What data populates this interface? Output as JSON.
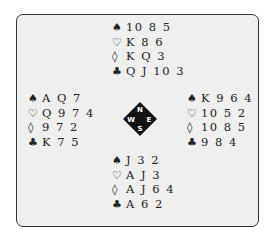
{
  "hands": {
    "north": [
      {
        "suit": "spades",
        "glyph": "♠",
        "cards": "10 8 5"
      },
      {
        "suit": "hearts",
        "glyph": "♡",
        "cards": "K 8 6"
      },
      {
        "suit": "diamonds",
        "glyph": "◊",
        "cards": "K Q 3"
      },
      {
        "suit": "clubs",
        "glyph": "♣",
        "cards": "Q J 10 3"
      }
    ],
    "west": [
      {
        "suit": "spades",
        "glyph": "♠",
        "cards": "A Q 7"
      },
      {
        "suit": "hearts",
        "glyph": "♡",
        "cards": "Q 9 7 4"
      },
      {
        "suit": "diamonds",
        "glyph": "◊",
        "cards": "9 7 2"
      },
      {
        "suit": "clubs",
        "glyph": "♣",
        "cards": "K 7 5"
      }
    ],
    "east": [
      {
        "suit": "spades",
        "glyph": "♠",
        "cards": "K 9 6 4"
      },
      {
        "suit": "hearts",
        "glyph": "♡",
        "cards": "10 5 2"
      },
      {
        "suit": "diamonds",
        "glyph": "◊",
        "cards": "10 8 5"
      },
      {
        "suit": "clubs",
        "glyph": "♣",
        "cards": "9 8 4"
      }
    ],
    "south": [
      {
        "suit": "spades",
        "glyph": "♠",
        "cards": "J 3 2"
      },
      {
        "suit": "hearts",
        "glyph": "♡",
        "cards": "A J 3"
      },
      {
        "suit": "diamonds",
        "glyph": "◊",
        "cards": "A J 6 4"
      },
      {
        "suit": "clubs",
        "glyph": "♣",
        "cards": "A 6 2"
      }
    ]
  },
  "compass": {
    "n": "N",
    "e": "E",
    "s": "S",
    "w": "W"
  }
}
